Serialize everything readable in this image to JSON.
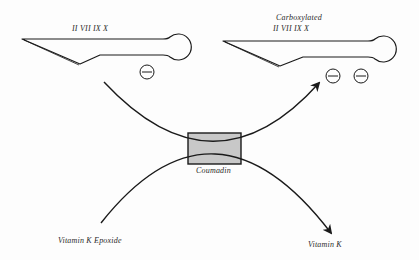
{
  "diagram": {
    "left_protein": {
      "factors_label": "II  VII  IX  X",
      "charges": 1
    },
    "right_protein": {
      "state_label": "Carboxylated",
      "factors_label": "II  VII  IX  X",
      "charges": 2
    },
    "inhibitor": {
      "label": "Coumadin",
      "box_fill": "#c8c8c8"
    },
    "substrates": {
      "left": "Vitamin K Epoxide",
      "right": "Vitamin K"
    },
    "charge_symbol": "minus",
    "colors": {
      "line": "#1a1a1a",
      "background": "#fdfdfd"
    }
  }
}
